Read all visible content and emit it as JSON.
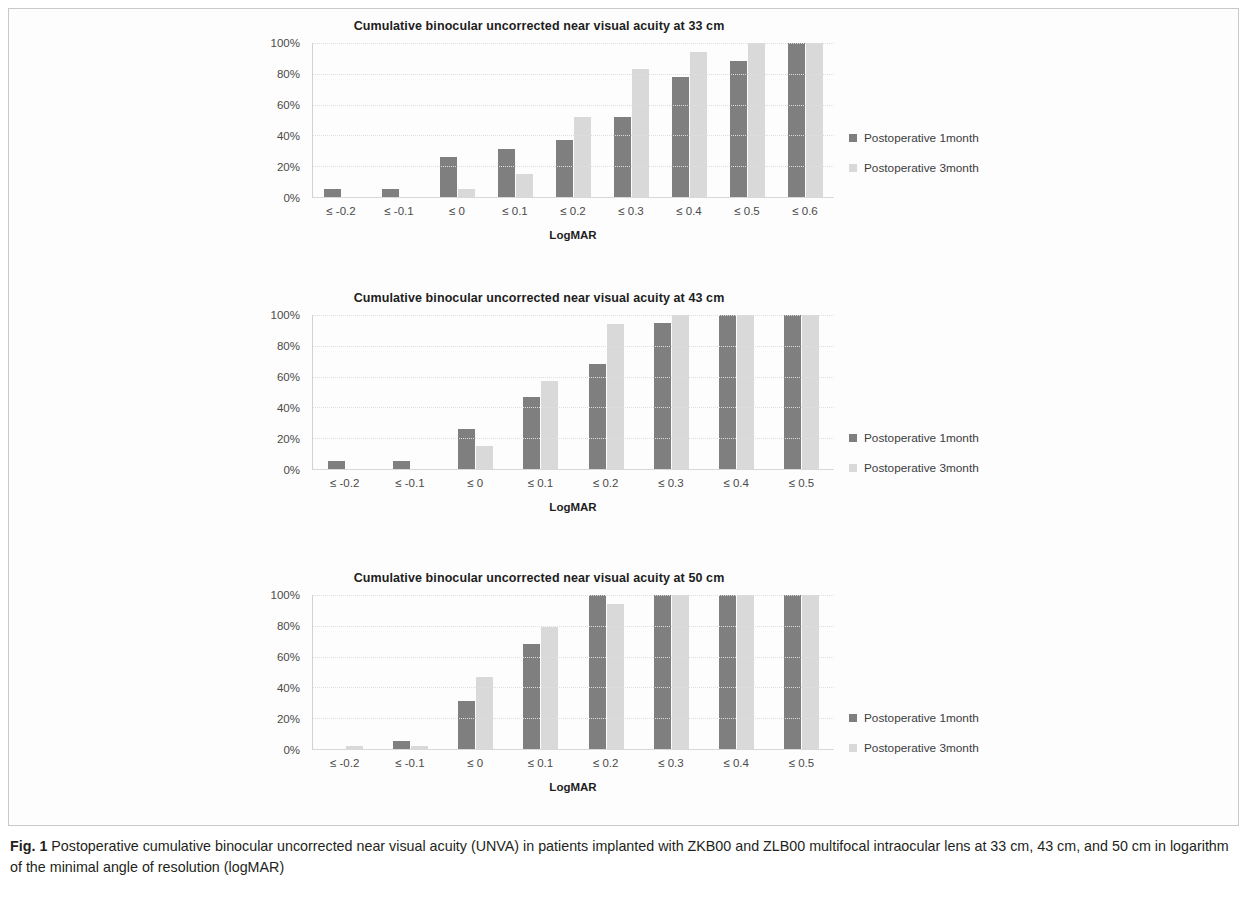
{
  "figure": {
    "caption_label": "Fig. 1",
    "caption_text": " Postoperative cumulative binocular uncorrected near visual acuity (UNVA) in patients implanted with ZKB00 and ZLB00 multifocal intraocular lens at 33 cm, 43 cm, and 50 cm in logarithm of the minimal angle of resolution (logMAR)"
  },
  "colors": {
    "series1": "#7f7f7f",
    "series2": "#d9d9d9",
    "gridline": "#dedede",
    "axis": "#d2d2d2",
    "text": "#231f20"
  },
  "legend": {
    "series1_label": "Postoperative 1month",
    "series2_label": "Postoperative 3month"
  },
  "chart_data": [
    {
      "type": "bar",
      "title": "Cumulative binocular uncorrected near visual acuity at 33 cm",
      "xlabel": "LogMAR",
      "ylabel": "",
      "ylim": [
        0,
        100
      ],
      "yticks": [
        "0%",
        "20%",
        "40%",
        "60%",
        "80%",
        "100%"
      ],
      "ytick_values": [
        0,
        20,
        40,
        60,
        80,
        100
      ],
      "grid": true,
      "legend_position": "right",
      "categories": [
        "≤ -0.2",
        "≤ -0.1",
        "≤ 0",
        "≤ 0.1",
        "≤ 0.2",
        "≤ 0.3",
        "≤ 0.4",
        "≤ 0.5",
        "≤ 0.6"
      ],
      "series": [
        {
          "name": "Postoperative 1month",
          "values": [
            5,
            5,
            26,
            31,
            37,
            52,
            78,
            88,
            100
          ]
        },
        {
          "name": "Postoperative 3month",
          "values": [
            0,
            0,
            5,
            15,
            52,
            83,
            94,
            100,
            100
          ]
        }
      ]
    },
    {
      "type": "bar",
      "title": "Cumulative binocular uncorrected near visual acuity at 43 cm",
      "xlabel": "LogMAR",
      "ylabel": "",
      "ylim": [
        0,
        100
      ],
      "yticks": [
        "0%",
        "20%",
        "40%",
        "60%",
        "80%",
        "100%"
      ],
      "ytick_values": [
        0,
        20,
        40,
        60,
        80,
        100
      ],
      "grid": true,
      "legend_position": "right",
      "categories": [
        "≤ -0.2",
        "≤ -0.1",
        "≤ 0",
        "≤ 0.1",
        "≤ 0.2",
        "≤ 0.3",
        "≤ 0.4",
        "≤ 0.5"
      ],
      "series": [
        {
          "name": "Postoperative 1month",
          "values": [
            5,
            5,
            26,
            47,
            68,
            95,
            100,
            100
          ]
        },
        {
          "name": "Postoperative 3month",
          "values": [
            0,
            0,
            15,
            57,
            94,
            100,
            100,
            100
          ]
        }
      ]
    },
    {
      "type": "bar",
      "title": "Cumulative binocular uncorrected near visual acuity at 50 cm",
      "xlabel": "LogMAR",
      "ylabel": "",
      "ylim": [
        0,
        100
      ],
      "yticks": [
        "0%",
        "20%",
        "40%",
        "60%",
        "80%",
        "100%"
      ],
      "ytick_values": [
        0,
        20,
        40,
        60,
        80,
        100
      ],
      "grid": true,
      "legend_position": "right",
      "categories": [
        "≤ -0.2",
        "≤ -0.1",
        "≤ 0",
        "≤ 0.1",
        "≤ 0.2",
        "≤ 0.3",
        "≤ 0.4",
        "≤ 0.5"
      ],
      "series": [
        {
          "name": "Postoperative 1month",
          "values": [
            0,
            5,
            31,
            68,
            100,
            100,
            100,
            100
          ]
        },
        {
          "name": "Postoperative 3month",
          "values": [
            2,
            2,
            47,
            79,
            94,
            100,
            100,
            100
          ]
        }
      ]
    }
  ]
}
